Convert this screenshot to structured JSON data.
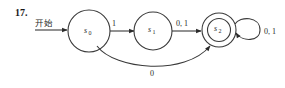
{
  "problem_number": "17.",
  "start_label": "开始",
  "states": [
    {
      "id": "s0",
      "name": "s",
      "sub": "0",
      "accepting": false,
      "start": true
    },
    {
      "id": "s1",
      "name": "s",
      "sub": "1",
      "accepting": false,
      "start": false
    },
    {
      "id": "s2",
      "name": "s",
      "sub": "2",
      "accepting": true,
      "start": false
    }
  ],
  "transitions": [
    {
      "from": "s0",
      "to": "s1",
      "label": "1"
    },
    {
      "from": "s1",
      "to": "s2",
      "label": "0, 1"
    },
    {
      "from": "s2",
      "to": "s2",
      "label": "0, 1"
    },
    {
      "from": "s0",
      "to": "s2",
      "label": "0"
    }
  ],
  "colors": {
    "stroke": "#3a3a3a",
    "text": "#2a2a2a",
    "background": "#ffffff"
  }
}
